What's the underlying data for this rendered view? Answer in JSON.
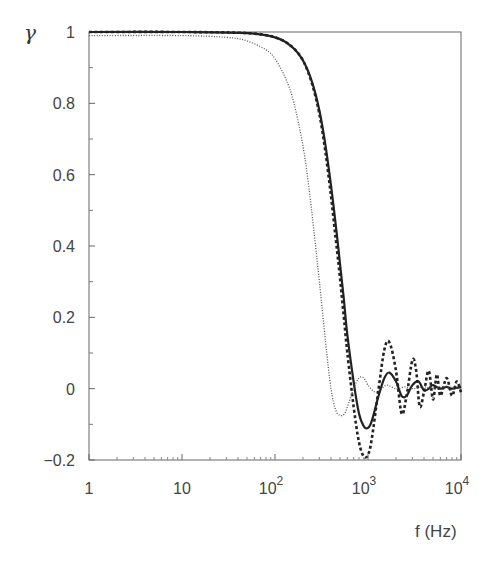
{
  "chart_data": {
    "type": "line",
    "title": "",
    "xlabel": "f (Hz)",
    "ylabel": "γ",
    "xscale": "log",
    "xlim": [
      1,
      10000
    ],
    "ylim": [
      -0.2,
      1
    ],
    "grid": false,
    "legend": null,
    "x_ticks": [
      {
        "value": 1,
        "label": "1"
      },
      {
        "value": 10,
        "label": "10"
      },
      {
        "value": 100,
        "label": "10",
        "sup": "2"
      },
      {
        "value": 1000,
        "label": "10",
        "sup": "3"
      },
      {
        "value": 10000,
        "label": "10",
        "sup": "4"
      }
    ],
    "y_ticks": [
      {
        "value": 1,
        "label": "1"
      },
      {
        "value": 0.8,
        "label": "0.8"
      },
      {
        "value": 0.6,
        "label": "0.6"
      },
      {
        "value": 0.4,
        "label": "0.4"
      },
      {
        "value": 0.2,
        "label": "0.2"
      },
      {
        "value": 0,
        "label": "0"
      },
      {
        "value": -0.2,
        "label": "−0.2"
      }
    ],
    "series": [
      {
        "name": "solid",
        "style": "solid",
        "color": "#222222",
        "x": [
          1,
          10,
          50,
          100,
          150,
          200,
          250,
          300,
          350,
          400,
          450,
          500,
          550,
          600,
          700,
          800,
          900,
          1000,
          1100,
          1300,
          1500,
          1700,
          2000,
          2300,
          2600,
          3000,
          3500,
          4000,
          4500,
          5000,
          6000,
          7000,
          8000,
          10000
        ],
        "y": [
          1.0,
          1.0,
          0.997,
          0.985,
          0.96,
          0.92,
          0.86,
          0.78,
          0.68,
          0.57,
          0.46,
          0.35,
          0.25,
          0.15,
          0.02,
          -0.07,
          -0.105,
          -0.11,
          -0.09,
          -0.02,
          0.03,
          0.045,
          0.02,
          -0.02,
          -0.02,
          0.01,
          0.02,
          -0.005,
          0.0,
          0.01,
          0.0,
          0.005,
          0.0,
          0.005
        ]
      },
      {
        "name": "dashed",
        "style": "dashed",
        "color": "#222222",
        "x": [
          1,
          10,
          50,
          100,
          150,
          200,
          250,
          300,
          350,
          400,
          450,
          500,
          550,
          600,
          700,
          800,
          900,
          1000,
          1100,
          1300,
          1500,
          1700,
          2000,
          2300,
          2600,
          3000,
          3300,
          3600,
          4000,
          4500,
          5000,
          5500,
          6000,
          7000,
          8000,
          9000,
          10000
        ],
        "y": [
          1.0,
          1.0,
          0.997,
          0.985,
          0.96,
          0.92,
          0.855,
          0.77,
          0.66,
          0.54,
          0.42,
          0.31,
          0.2,
          0.1,
          -0.05,
          -0.15,
          -0.19,
          -0.185,
          -0.14,
          0.0,
          0.11,
          0.13,
          0.05,
          -0.07,
          -0.02,
          0.08,
          0.05,
          -0.05,
          -0.01,
          0.05,
          -0.03,
          0.04,
          -0.02,
          0.03,
          -0.02,
          0.02,
          -0.01
        ]
      },
      {
        "name": "dotted",
        "style": "dotted",
        "color": "#555555",
        "x": [
          1,
          10,
          30,
          50,
          80,
          100,
          130,
          160,
          200,
          230,
          260,
          300,
          350,
          400,
          450,
          500,
          560,
          620,
          700,
          800,
          900,
          1000,
          1200,
          1400,
          1600,
          2000,
          2500,
          3000,
          4000,
          5000,
          7000,
          10000
        ],
        "y": [
          0.99,
          0.99,
          0.985,
          0.975,
          0.95,
          0.925,
          0.87,
          0.8,
          0.68,
          0.57,
          0.45,
          0.3,
          0.13,
          0.0,
          -0.06,
          -0.075,
          -0.07,
          -0.04,
          0.0,
          0.03,
          0.03,
          0.01,
          -0.01,
          0.0,
          0.01,
          0.0,
          0.005,
          0.0,
          0.005,
          0.0,
          0.005,
          0.0
        ]
      }
    ]
  }
}
